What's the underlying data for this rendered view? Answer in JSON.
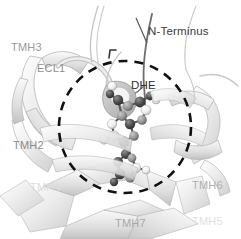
{
  "figure": {
    "type": "molecular-structure-ribbon-diagram",
    "background_color": "#ffffff",
    "width": 241,
    "height": 239
  },
  "labels": {
    "tmh3": "TMH3",
    "ecl1": "ECL1",
    "n_terminus": "N-Terminus",
    "ligand": "DHE",
    "tmh2": "TMH2",
    "tmh4": "TMH4",
    "tmh6": "TMH6",
    "tmh5": "TMH5",
    "tmh7": "TMH7"
  },
  "label_colors": {
    "tmh3": "#9a9a9a",
    "ecl1": "#8e8e8e",
    "n_terminus": "#3c3c3c",
    "ligand": "#2f2f2f",
    "tmh2": "#8a8a8a",
    "tmh4": "#dddddd",
    "tmh6": "#b0b0b0",
    "tmh5": "#e2e2e2",
    "tmh7": "#a8a8a8"
  },
  "annotations": {
    "binding_pocket_circle": {
      "style": "dashed",
      "color": "#111111",
      "center_x": 125,
      "center_y": 127,
      "radius": 66,
      "stroke_width": 2.6,
      "dash_pattern": "9 7"
    },
    "leader_line_n_terminus": {
      "color": "#555555",
      "from_x": 147,
      "from_y": 43,
      "to_x": 136,
      "to_y": 18
    },
    "tick_mark": {
      "color": "#333333",
      "x": 110,
      "y": 52
    }
  },
  "ligand": {
    "name": "DHE",
    "representation": "ball-and-stick",
    "atom_colors": [
      "#3a3a3a",
      "#6b6b6b",
      "#f2f2f2",
      "#b8b8b8"
    ]
  },
  "ribbon": {
    "fill_light": "#f4f4f4",
    "fill_mid": "#dcdcdc",
    "fill_dark": "#bdbdbd",
    "outline": "#9e9e9e"
  }
}
